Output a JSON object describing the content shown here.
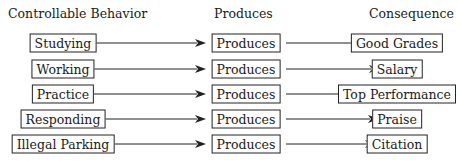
{
  "headers": {
    "behavior": "Controllable Behavior",
    "produces": "Produces",
    "consequence": "Consequence"
  },
  "rows": [
    {
      "behavior": "Studying",
      "produces": "Produces",
      "consequence": "Good Grades"
    },
    {
      "behavior": "Working",
      "produces": "Produces",
      "consequence": "Salary"
    },
    {
      "behavior": "Practice",
      "produces": "Produces",
      "consequence": "Top Performance"
    },
    {
      "behavior": "Responding",
      "produces": "Produces",
      "consequence": "Praise"
    },
    {
      "behavior": "Illegal Parking",
      "produces": "Produces",
      "consequence": "Citation"
    }
  ],
  "layout": {
    "col_x": [
      63,
      246,
      397
    ],
    "row_y": [
      43,
      69,
      94,
      119,
      144
    ],
    "left_box_right": [
      90,
      88,
      90,
      97,
      103
    ],
    "mid_box_left": 206,
    "mid_box_right": 286,
    "right_box_left": [
      362,
      380,
      353,
      379,
      376
    ]
  },
  "colors": {
    "line": "#222222",
    "text": "#1a1a1a",
    "background": "#ffffff"
  }
}
